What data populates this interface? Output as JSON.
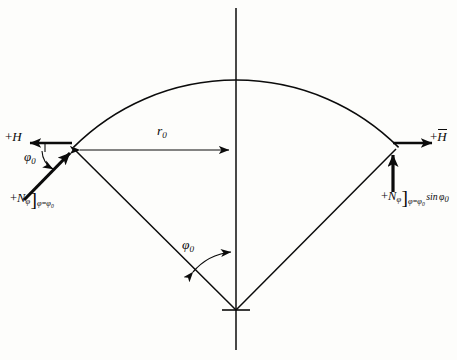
{
  "figure": {
    "kind": "free-body-diagram",
    "background_color": "#fdfdfb",
    "ink_color": "#0b0b0b"
  },
  "geometry": {
    "apex": {
      "x": 236,
      "y": 310
    },
    "left_vertex": {
      "x": 72,
      "y": 150
    },
    "right_vertex": {
      "x": 393,
      "y": 152
    },
    "arc_crown": {
      "x": 236,
      "y": 80
    },
    "axis_top": {
      "x": 236,
      "y": 8
    },
    "axis_bottom": {
      "x": 236,
      "y": 350
    },
    "radius": 230,
    "half_angle_deg": 45
  },
  "labels": {
    "h_left": {
      "sign": "+",
      "symbol": "H",
      "overbar": false
    },
    "h_right": {
      "sign": "+",
      "symbol": "H",
      "overbar": true
    },
    "radius": {
      "symbol": "r",
      "subscript": "0"
    },
    "angle_left": {
      "symbol": "φ",
      "subscript": "0"
    },
    "angle_center": {
      "symbol": "φ",
      "subscript": "0"
    },
    "n_phi_left": {
      "sign": "+",
      "symbol": "N",
      "symbol_subscript": "φ",
      "bracket": "]",
      "condition_var": "φ",
      "condition_eq": "=",
      "condition_val": "φ",
      "condition_val_sub": "0"
    },
    "n_phi_right": {
      "sign": "+",
      "symbol": "N",
      "symbol_subscript": "φ",
      "bracket": "]",
      "condition_var": "φ",
      "condition_eq": "=",
      "condition_val": "φ",
      "condition_val_sub": "0",
      "factor_fn": "sin",
      "factor_arg": "φ",
      "factor_arg_sub": "0"
    }
  },
  "elements": {
    "vertical_axis": "vertical centerline axis",
    "arc": "shell meridian arc",
    "left_radius_line": "radius line apex to left edge",
    "right_radius_line": "radius line apex to right edge",
    "r0_arrow": "double-headed horizontal dimension arrow",
    "phi0_arc_arrow": "double-headed angular dimension arc",
    "left_force_arrow": "inclined meridional force N-phi at left edge",
    "left_h_arrow": "horizontal thrust H pointing left",
    "right_force_arrow": "vertical force component pointing up",
    "right_h_arrow": "horizontal thrust H-bar pointing right",
    "apex_tick": "short horizontal tick at apex"
  }
}
